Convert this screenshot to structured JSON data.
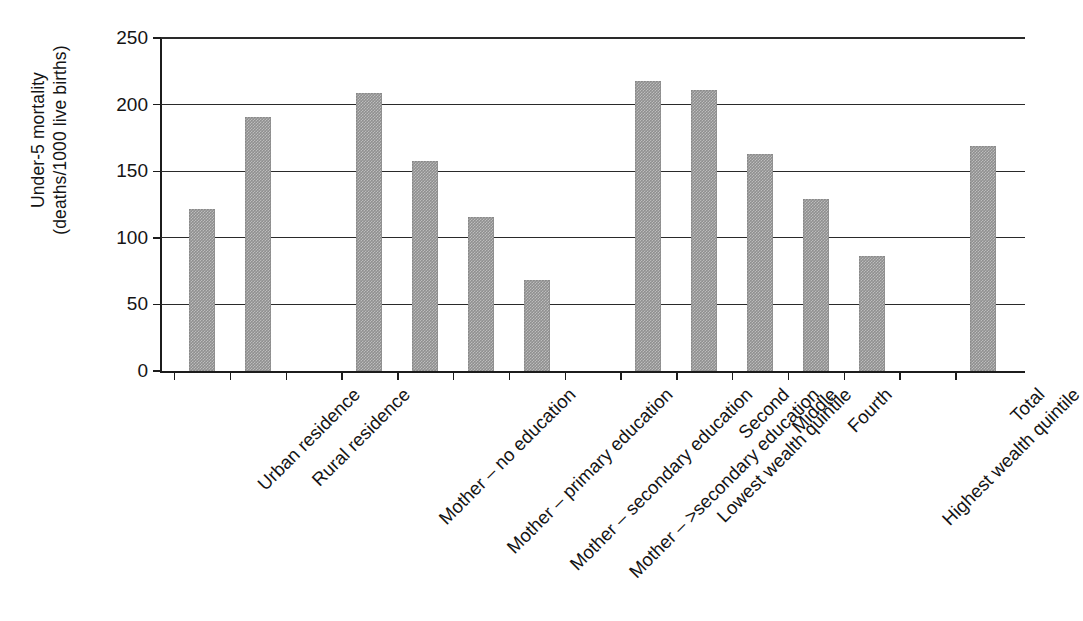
{
  "chart_data": {
    "type": "bar",
    "title": "",
    "xlabel": "",
    "ylabel": "Under-5 mortality\n(deaths/1000 live births)",
    "ylim": [
      0,
      250
    ],
    "ytick_values": [
      0,
      50,
      100,
      150,
      200,
      250
    ],
    "ytick_labels": [
      "0",
      "50",
      "100",
      "150",
      "200",
      "250"
    ],
    "grid": "horizontal",
    "legend": "none",
    "bar_color": "#8f8f8f",
    "axis_color": "#1c1c1c",
    "categories": [
      "Urban residence",
      "Rural residence",
      "",
      "Mother – no education",
      "Mother – primary education",
      "Mother – secondary education",
      "Mother – >secondary education",
      "",
      "Lowest wealth quintile",
      "Second",
      "Middle",
      "Fourth",
      "Highest wealth quintile",
      "",
      "Total"
    ],
    "values": [
      122,
      191,
      null,
      209,
      158,
      116,
      68,
      null,
      218,
      211,
      163,
      129,
      86,
      null,
      169
    ]
  },
  "axis": {
    "y_title_line1": "Under-5 mortality",
    "y_title_line2": "(deaths/1000 live births)"
  },
  "bars": [
    {
      "label": "Urban residence",
      "value": 122
    },
    {
      "label": "Rural residence",
      "value": 191
    },
    {
      "label": "Mother – no education",
      "value": 209
    },
    {
      "label": "Mother – primary education",
      "value": 158
    },
    {
      "label": "Mother – secondary education",
      "value": 116
    },
    {
      "label": "Mother – >secondary education",
      "value": 68
    },
    {
      "label": "Lowest wealth quintile",
      "value": 218
    },
    {
      "label": "Second",
      "value": 211
    },
    {
      "label": "Middle",
      "value": 163
    },
    {
      "label": "Fourth",
      "value": 129
    },
    {
      "label": "Highest wealth quintile",
      "value": 86
    },
    {
      "label": "Total",
      "value": 169
    }
  ],
  "ticks": {
    "y": [
      "250",
      "200",
      "150",
      "100",
      "50",
      "0"
    ]
  }
}
